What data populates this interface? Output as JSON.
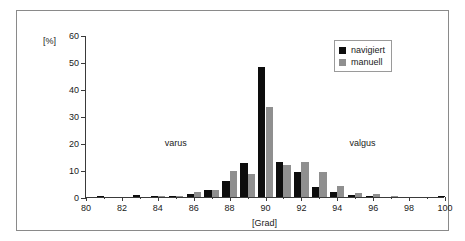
{
  "chart_data": {
    "type": "bar",
    "title": "",
    "subtitle": "",
    "xlabel": "[Grad]",
    "ylabel": "[%]",
    "xlim": [
      80,
      100
    ],
    "ylim": [
      0,
      60
    ],
    "yticks": [
      0,
      10,
      20,
      30,
      40,
      50,
      60
    ],
    "xticks": [
      80,
      82,
      84,
      86,
      88,
      90,
      92,
      94,
      96,
      98,
      100
    ],
    "x_minor_step": 1,
    "grid": false,
    "legend_position": "top-right",
    "categories": [
      80,
      81,
      82,
      83,
      84,
      85,
      86,
      87,
      88,
      89,
      90,
      91,
      92,
      93,
      94,
      95,
      96,
      97,
      98,
      99,
      100
    ],
    "series": [
      {
        "name": "navigiert",
        "color": "#0d0d0d",
        "values": [
          0,
          0.4,
          0,
          0.7,
          0.3,
          0.4,
          1.0,
          2.7,
          6.0,
          12.5,
          48.0,
          12.9,
          9.3,
          3.6,
          1.8,
          0.7,
          0.3,
          0,
          0,
          0,
          0.3
        ]
      },
      {
        "name": "manuell",
        "color": "#8f8f8f",
        "values": [
          0,
          0,
          0,
          0,
          0.3,
          0.4,
          1.9,
          2.7,
          9.7,
          8.6,
          33.5,
          12.0,
          13.0,
          9.3,
          4.1,
          1.4,
          1.2,
          0.3,
          0,
          0,
          0
        ]
      }
    ],
    "annotations": [
      {
        "text": "varus",
        "x": 85.0,
        "y": 20.0
      },
      {
        "text": "valgus",
        "x": 95.4,
        "y": 20.0
      }
    ]
  },
  "legend": {
    "entries": [
      {
        "label": "navigiert",
        "swatch": "navigiert"
      },
      {
        "label": "manuell",
        "swatch": "manuell"
      }
    ]
  },
  "colors": {
    "navigiert": "#0d0d0d",
    "manuell": "#8f8f8f",
    "axis": "#3a3a3a",
    "frame": "#8a8a8a",
    "background": "#ffffff"
  }
}
